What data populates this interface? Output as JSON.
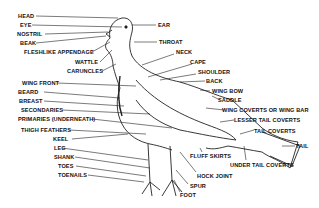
{
  "diagram": {
    "labels_left": [
      "HEAD",
      "EYE",
      "NOSTRIL",
      "BEAK",
      "FLESHLIKE APPENDAGE",
      "WATTLE",
      "CARUNCLES",
      "WING FRONT",
      "BEARD",
      "BREAST",
      "SECONDARIES",
      "PRIMARIES (UNDERNEATH)",
      "THIGH FEATHERS",
      "KEEL",
      "LEG",
      "SHANK",
      "TOES",
      "TOENAILS"
    ],
    "labels_right": [
      "EAR",
      "THROAT",
      "NECK",
      "CAPE",
      "SHOULDER",
      "BACK",
      "WING BOW",
      "SADDLE",
      "WING COVERTS OR WING BAR",
      "LESSER TAIL COVERTS",
      "TAIL COVERTS",
      "TAIL",
      "FLUFF SKIRTS",
      "UNDER TAIL COVERTS",
      "HOCK JOINT",
      "SPUR",
      "FOOT"
    ]
  }
}
